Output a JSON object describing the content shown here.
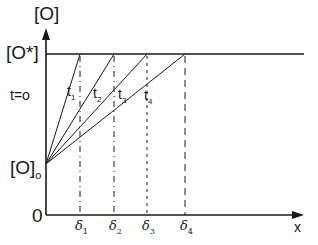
{
  "diagram": {
    "y_axis_label": "[O]",
    "x_axis_label": "x",
    "origin_label": "0",
    "saturation_label": "[O*]",
    "initial_label": "[O]",
    "initial_subscript": "o",
    "time_zero_label": "t=o",
    "lines": [
      {
        "label": "t",
        "sub": "1"
      },
      {
        "label": "t",
        "sub": "2"
      },
      {
        "label": "t",
        "sub": "3"
      },
      {
        "label": "t",
        "sub": "4"
      }
    ],
    "depths": [
      {
        "label": "δ",
        "sub": "1"
      },
      {
        "label": "δ",
        "sub": "2"
      },
      {
        "label": "δ",
        "sub": "3"
      },
      {
        "label": "δ",
        "sub": "4"
      }
    ]
  }
}
